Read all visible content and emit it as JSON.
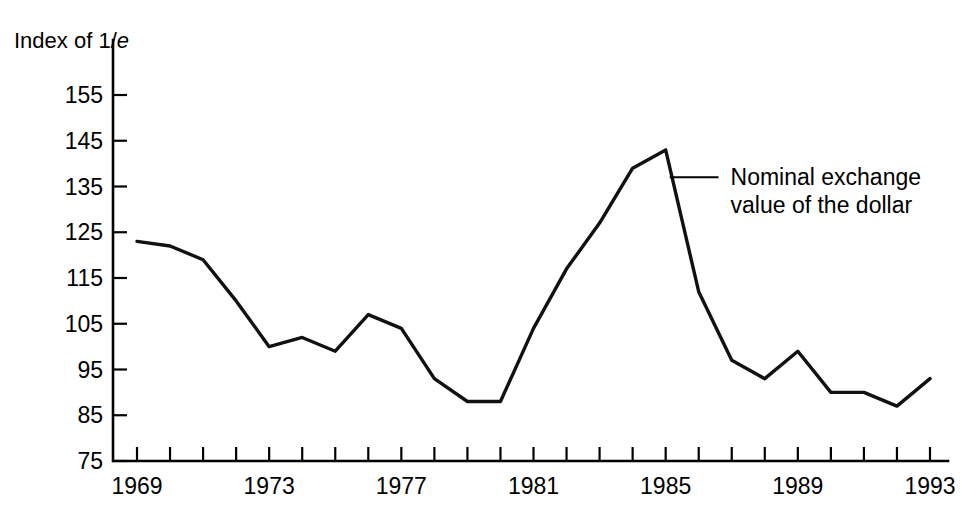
{
  "chart_data": {
    "type": "line",
    "title": "",
    "ylabel": "Index of 1/e",
    "ylabel_prefix": "Index of 1/",
    "ylabel_italic": "e",
    "xlabel": "",
    "ylim": [
      75,
      155
    ],
    "xlim": [
      1969,
      1993
    ],
    "grid": false,
    "legend_position": "none",
    "y_ticks": [
      75,
      85,
      95,
      105,
      115,
      125,
      135,
      145,
      155
    ],
    "y_tick_labels": [
      "75",
      "85",
      "95",
      "105",
      "115",
      "125",
      "135",
      "145",
      "155"
    ],
    "x_ticks": [
      1969,
      1970,
      1971,
      1972,
      1973,
      1974,
      1975,
      1976,
      1977,
      1978,
      1979,
      1980,
      1981,
      1982,
      1983,
      1984,
      1985,
      1986,
      1987,
      1988,
      1989,
      1990,
      1991,
      1992,
      1993
    ],
    "x_tick_labels": [
      "1969",
      "",
      "",
      "",
      "1973",
      "",
      "",
      "",
      "1977",
      "",
      "",
      "",
      "1981",
      "",
      "",
      "",
      "1985",
      "",
      "",
      "",
      "1989",
      "",
      "",
      "",
      "1993"
    ],
    "x_labeled_ticks": [
      1969,
      1973,
      1977,
      1981,
      1985,
      1989,
      1993
    ],
    "series": [
      {
        "name": "Nominal exchange value of the dollar",
        "color": "#111111",
        "x": [
          1969,
          1970,
          1971,
          1972,
          1973,
          1974,
          1975,
          1976,
          1977,
          1978,
          1979,
          1980,
          1981,
          1982,
          1983,
          1984,
          1985,
          1986,
          1987,
          1988,
          1989,
          1990,
          1991,
          1992,
          1993
        ],
        "values": [
          123,
          122,
          119,
          110,
          100,
          102,
          99,
          107,
          104,
          93,
          88,
          88,
          104,
          117,
          127,
          139,
          143,
          112,
          97,
          93,
          99,
          90,
          90,
          87,
          93
        ]
      }
    ],
    "annotations": [
      {
        "name": "series-callout",
        "line1": "Nominal exchange",
        "line2": "value of the dollar",
        "anchor_x": 1985,
        "anchor_y": 137,
        "text_x": 1986.6,
        "text_y": 137
      }
    ]
  }
}
